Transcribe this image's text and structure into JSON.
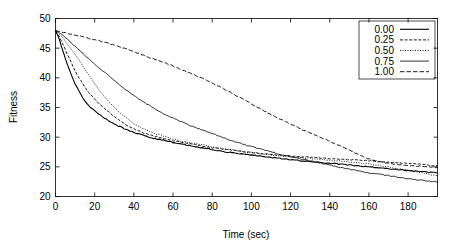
{
  "chart_data": {
    "type": "line",
    "title": "",
    "xlabel": "Time (sec)",
    "ylabel": "Fitness",
    "xlim": [
      0,
      195
    ],
    "ylim": [
      20,
      50
    ],
    "xticks": [
      0,
      20,
      40,
      60,
      80,
      100,
      120,
      140,
      160,
      180
    ],
    "yticks": [
      20,
      25,
      30,
      35,
      40,
      45,
      50
    ],
    "grid": false,
    "legend_position": "top-right",
    "legend_entries": [
      "0.00",
      "0.25",
      "0.50",
      "0.75",
      "1.00"
    ],
    "series": [
      {
        "name": "0.00",
        "style": "solid",
        "stroke_width": 1.1,
        "dash": "none",
        "x": [
          0,
          2,
          4,
          6,
          8,
          10,
          12,
          14,
          16,
          18,
          20,
          24,
          28,
          32,
          36,
          40,
          45,
          50,
          55,
          60,
          65,
          70,
          75,
          80,
          85,
          90,
          95,
          100,
          110,
          120,
          130,
          140,
          150,
          160,
          170,
          180,
          190,
          195
        ],
        "values": [
          48.0,
          46.4,
          44.3,
          42.3,
          40.6,
          39.0,
          37.7,
          36.6,
          35.7,
          35.0,
          34.4,
          33.4,
          32.6,
          31.9,
          31.3,
          30.8,
          30.3,
          29.8,
          29.5,
          29.1,
          28.8,
          28.5,
          28.2,
          27.9,
          27.6,
          27.4,
          27.2,
          27.0,
          26.6,
          26.2,
          25.9,
          25.6,
          25.3,
          25.0,
          24.7,
          24.4,
          24.1,
          24.0
        ]
      },
      {
        "name": "0.25",
        "style": "dashed",
        "stroke_width": 0.9,
        "dash": "3,1.6",
        "x": [
          0,
          2,
          4,
          6,
          8,
          10,
          12,
          14,
          16,
          18,
          20,
          24,
          28,
          32,
          36,
          40,
          45,
          50,
          55,
          60,
          65,
          70,
          75,
          80,
          85,
          90,
          95,
          100,
          110,
          120,
          130,
          140,
          150,
          160,
          170,
          180,
          190,
          195
        ],
        "values": [
          48.0,
          46.9,
          45.5,
          44.0,
          42.6,
          41.2,
          40.0,
          38.9,
          37.9,
          37.1,
          36.4,
          35.1,
          34.0,
          33.0,
          32.1,
          31.4,
          30.7,
          30.2,
          29.8,
          29.4,
          29.1,
          28.8,
          28.5,
          28.2,
          28.0,
          27.8,
          27.6,
          27.4,
          27.1,
          26.8,
          26.6,
          26.4,
          26.2,
          26.0,
          25.8,
          25.6,
          25.3,
          25.2
        ]
      },
      {
        "name": "0.50",
        "style": "dotted",
        "stroke_width": 0.9,
        "dash": "1,1.5",
        "x": [
          0,
          2,
          4,
          6,
          8,
          10,
          12,
          14,
          16,
          18,
          20,
          24,
          28,
          32,
          36,
          40,
          45,
          50,
          55,
          60,
          65,
          70,
          75,
          80,
          85,
          90,
          95,
          100,
          110,
          120,
          130,
          140,
          150,
          160,
          170,
          180,
          190,
          195
        ],
        "values": [
          48.0,
          47.4,
          46.6,
          45.7,
          44.8,
          43.9,
          43.0,
          42.0,
          41.0,
          40.0,
          39.0,
          37.2,
          35.7,
          34.4,
          33.3,
          32.3,
          31.4,
          30.7,
          30.2,
          29.7,
          29.3,
          29.0,
          28.7,
          28.4,
          28.1,
          27.9,
          27.6,
          27.4,
          27.0,
          26.7,
          26.4,
          26.1,
          25.8,
          25.5,
          25.0,
          24.4,
          23.8,
          23.5
        ]
      },
      {
        "name": "0.75",
        "style": "solid-thin",
        "stroke_width": 0.8,
        "dash": "none",
        "x": [
          0,
          2,
          4,
          6,
          8,
          10,
          12,
          14,
          16,
          18,
          20,
          24,
          28,
          32,
          36,
          40,
          45,
          50,
          55,
          60,
          65,
          70,
          75,
          80,
          85,
          90,
          95,
          100,
          110,
          120,
          130,
          140,
          150,
          160,
          170,
          180,
          190,
          195
        ],
        "values": [
          48.0,
          47.6,
          47.1,
          46.5,
          45.9,
          45.3,
          44.7,
          44.1,
          43.5,
          42.9,
          42.3,
          41.2,
          40.1,
          39.0,
          38.0,
          37.0,
          35.9,
          34.9,
          34.0,
          33.2,
          32.5,
          31.8,
          31.2,
          30.6,
          30.0,
          29.4,
          28.9,
          28.4,
          27.5,
          26.7,
          26.0,
          25.3,
          24.6,
          24.0,
          23.5,
          23.0,
          22.6,
          22.5
        ]
      },
      {
        "name": "1.00",
        "style": "dash-long",
        "stroke_width": 0.9,
        "dash": "4.5,2",
        "x": [
          0,
          5,
          10,
          15,
          20,
          25,
          30,
          35,
          40,
          45,
          50,
          55,
          60,
          65,
          70,
          75,
          80,
          85,
          90,
          95,
          100,
          105,
          110,
          115,
          120,
          125,
          130,
          135,
          140,
          145,
          150,
          155,
          160,
          165,
          170,
          175,
          180,
          185,
          190,
          195
        ],
        "values": [
          48.0,
          47.6,
          47.2,
          46.8,
          46.4,
          46.0,
          45.5,
          45.0,
          44.4,
          43.8,
          43.2,
          42.6,
          42.0,
          41.3,
          40.6,
          39.9,
          39.1,
          38.3,
          37.4,
          36.5,
          35.6,
          34.7,
          33.8,
          33.0,
          32.2,
          31.4,
          30.7,
          30.0,
          29.3,
          28.6,
          27.8,
          27.0,
          26.3,
          25.9,
          25.6,
          25.4,
          25.2,
          25.1,
          25.0,
          24.9
        ]
      }
    ]
  },
  "axis": {
    "ylabel": "Fitness",
    "xlabel": "Time (sec)",
    "ytick_labels": [
      "50",
      "45",
      "40",
      "35",
      "30",
      "25",
      "20"
    ],
    "xtick_labels": [
      "0",
      "20",
      "40",
      "60",
      "80",
      "100",
      "120",
      "140",
      "160",
      "180"
    ]
  },
  "legend": {
    "items": [
      {
        "label": "0.00"
      },
      {
        "label": "0.25"
      },
      {
        "label": "0.50"
      },
      {
        "label": "0.75"
      },
      {
        "label": "1.00"
      }
    ]
  },
  "colors": {
    "line": "#000000",
    "background": "#ffffff",
    "axis": "#000000"
  }
}
